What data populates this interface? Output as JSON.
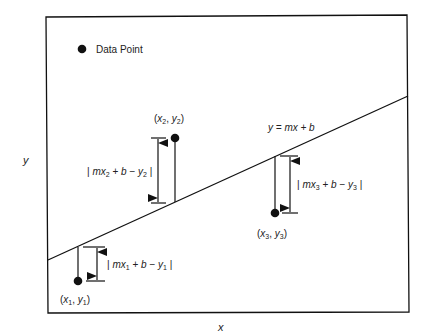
{
  "diagram": {
    "type": "least-squares regression illustration",
    "legend": {
      "marker": "filled-circle",
      "label": "Data Point"
    },
    "axes": {
      "xlabel": "x",
      "ylabel": "y"
    },
    "line": {
      "equation": "y = mx + b"
    },
    "points": [
      {
        "id": "p1",
        "label": "(x1, y1)",
        "residual": "| mx1 + b − y1 |"
      },
      {
        "id": "p2",
        "label": "(x2, y2)",
        "residual": "| mx2 + b − y2 |"
      },
      {
        "id": "p3",
        "label": "(x3, y3)",
        "residual": "| mx3 + b − y3 |"
      }
    ],
    "colors": {
      "ink": "#111111",
      "text": "#222222",
      "background": "#ffffff"
    }
  }
}
